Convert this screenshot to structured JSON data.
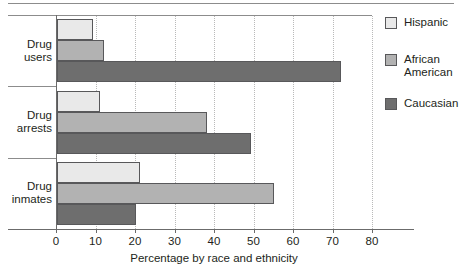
{
  "chart_data": {
    "type": "bar",
    "orientation": "horizontal",
    "title": "",
    "subtitle": "",
    "xlabel": "Percentage by race and ethnicity",
    "ylabel": "",
    "xlim": [
      0,
      80
    ],
    "xticks": [
      0,
      10,
      20,
      30,
      40,
      50,
      60,
      70,
      80
    ],
    "grid": "vertical-dotted",
    "legend_position": "right",
    "categories": [
      "Drug users",
      "Drug arrests",
      "Drug inmates"
    ],
    "category_labels": [
      [
        "Drug",
        "users"
      ],
      [
        "Drug",
        "arrests"
      ],
      [
        "Drug",
        "inmates"
      ]
    ],
    "series": [
      {
        "name": "Hispanic",
        "color": "#e9e9e9",
        "values": [
          9,
          11,
          21
        ]
      },
      {
        "name": "African American",
        "color": "#b2b2b2",
        "values": [
          12,
          38,
          55
        ]
      },
      {
        "name": "Caucasian",
        "color": "#6e6e6e",
        "values": [
          72,
          49,
          20
        ]
      }
    ],
    "legend_entries": [
      {
        "label": "Hispanic",
        "color": "#e9e9e9"
      },
      {
        "label": "African\nAmerican",
        "color": "#b2b2b2"
      },
      {
        "label": "Caucasian",
        "color": "#6e6e6e"
      }
    ]
  },
  "colors": {
    "hispanic": "#e9e9e9",
    "african_american": "#b2b2b2",
    "caucasian": "#6e6e6e",
    "axis": "#6b6b6b",
    "grid": "#b9b9b9",
    "text": "#231f20"
  },
  "axis": {
    "x_title": "Percentage by race and ethnicity",
    "tick_labels": [
      "0",
      "10",
      "20",
      "30",
      "40",
      "50",
      "60",
      "70",
      "80"
    ]
  },
  "legend": {
    "items": [
      {
        "label": "Hispanic"
      },
      {
        "label": "African American"
      },
      {
        "label": "Caucasian"
      }
    ]
  }
}
